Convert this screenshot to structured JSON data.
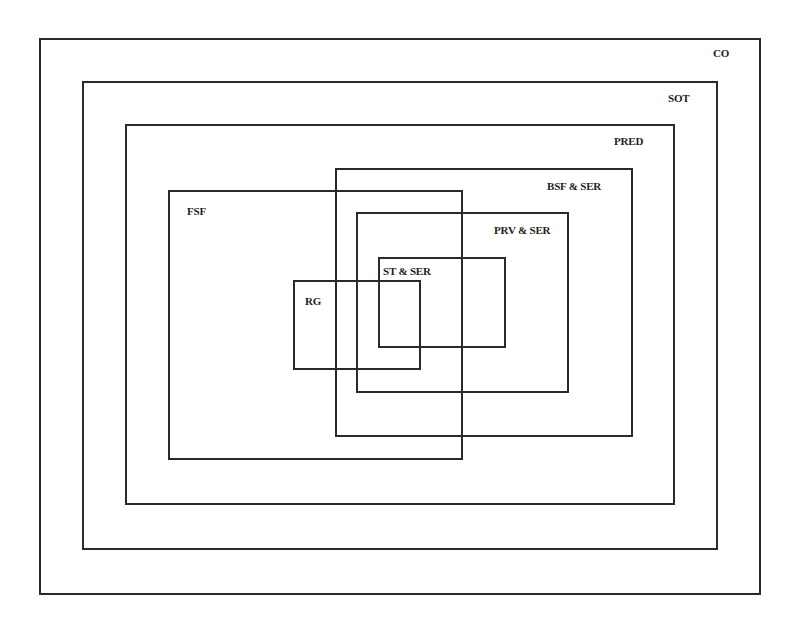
{
  "diagram": {
    "type": "nested-sets",
    "line_color": "#2a2a2a",
    "sets": [
      {
        "id": "co",
        "label": "CO",
        "box": {
          "left": 39,
          "top": 38,
          "right": 761,
          "bottom": 595
        },
        "label_pos": {
          "x": 713,
          "y": 47
        }
      },
      {
        "id": "sot",
        "label": "SOT",
        "box": {
          "left": 82,
          "top": 81,
          "right": 718,
          "bottom": 550
        },
        "label_pos": {
          "x": 668,
          "y": 92
        }
      },
      {
        "id": "pred",
        "label": "PRED",
        "box": {
          "left": 125,
          "top": 124,
          "right": 675,
          "bottom": 505
        },
        "label_pos": {
          "x": 614,
          "y": 135
        }
      },
      {
        "id": "bsf",
        "label": "BSF & SER",
        "box": {
          "left": 335,
          "top": 168,
          "right": 633,
          "bottom": 437
        },
        "label_pos": {
          "x": 547,
          "y": 180
        }
      },
      {
        "id": "fsf",
        "label": "FSF",
        "box": {
          "left": 168,
          "top": 190,
          "right": 463,
          "bottom": 460
        },
        "label_pos": {
          "x": 187,
          "y": 205
        }
      },
      {
        "id": "prv",
        "label": "PRV & SER",
        "box": {
          "left": 356,
          "top": 212,
          "right": 569,
          "bottom": 393
        },
        "label_pos": {
          "x": 494,
          "y": 224
        }
      },
      {
        "id": "st",
        "label": "ST & SER",
        "box": {
          "left": 378,
          "top": 257,
          "right": 506,
          "bottom": 348
        },
        "label_pos": {
          "x": 383,
          "y": 265
        }
      },
      {
        "id": "rg",
        "label": "RG",
        "box": {
          "left": 293,
          "top": 280,
          "right": 421,
          "bottom": 370
        },
        "label_pos": {
          "x": 305,
          "y": 295
        }
      }
    ]
  }
}
